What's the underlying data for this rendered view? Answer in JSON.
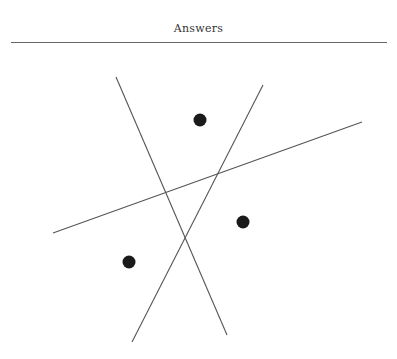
{
  "header": {
    "title": "Answers"
  },
  "diagram": {
    "colors": {
      "line": "#555555",
      "rule": "#666666",
      "point": "#1a1a1a"
    },
    "rule": {
      "x1": 11,
      "y1": 42.5,
      "x2": 387,
      "y2": 42.5
    },
    "lines": [
      {
        "id": "line-1",
        "x1": 116,
        "y1": 77,
        "x2": 227,
        "y2": 335
      },
      {
        "id": "line-2",
        "x1": 263,
        "y1": 85,
        "x2": 132,
        "y2": 342
      },
      {
        "id": "line-3",
        "x1": 53,
        "y1": 233,
        "x2": 362,
        "y2": 122
      }
    ],
    "points": [
      {
        "id": "point-1",
        "cx": 200,
        "cy": 120,
        "r": 6.5
      },
      {
        "id": "point-2",
        "cx": 243,
        "cy": 222,
        "r": 6.5
      },
      {
        "id": "point-3",
        "cx": 129,
        "cy": 262,
        "r": 6.5
      }
    ]
  }
}
